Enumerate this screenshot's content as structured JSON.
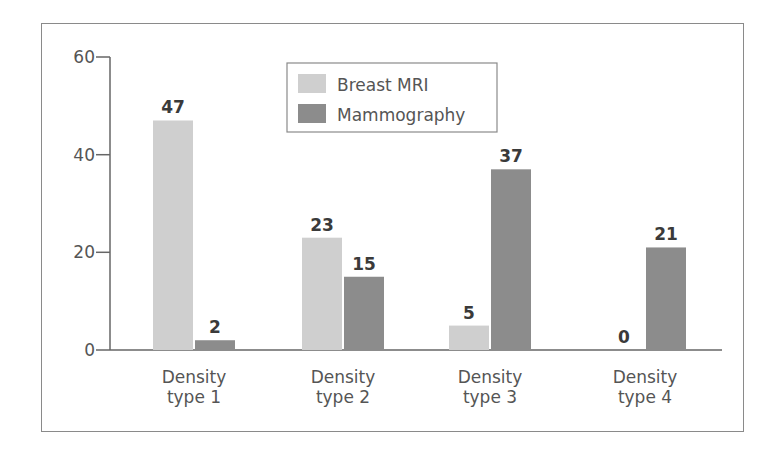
{
  "chart_data": {
    "type": "bar",
    "title": "",
    "xlabel": "",
    "ylabel": "",
    "ylim": [
      0,
      60
    ],
    "yticks": [
      0,
      20,
      40,
      60
    ],
    "grid": false,
    "legend_position": "top-center (inside)",
    "categories": [
      "Density type 1",
      "Density type 2",
      "Density type 3",
      "Density type 4"
    ],
    "category_lines": [
      [
        "Density",
        "type 1"
      ],
      [
        "Density",
        "type 2"
      ],
      [
        "Density",
        "type 3"
      ],
      [
        "Density",
        "type 4"
      ]
    ],
    "series": [
      {
        "name": "Breast MRI",
        "color": "#cfcfcf",
        "values": [
          47,
          23,
          5,
          0
        ]
      },
      {
        "name": "Mammography",
        "color": "#8c8c8c",
        "values": [
          2,
          15,
          37,
          21
        ]
      }
    ]
  },
  "legend": {
    "items": [
      {
        "label": "Breast MRI",
        "color": "#cfcfcf"
      },
      {
        "label": "Mammography",
        "color": "#8c8c8c"
      }
    ]
  },
  "axis": {
    "y_tick_labels": [
      "0",
      "20",
      "40",
      "60"
    ]
  },
  "value_labels": {
    "mri": [
      "47",
      "23",
      "5",
      "0"
    ],
    "mammo": [
      "2",
      "15",
      "37",
      "21"
    ]
  }
}
